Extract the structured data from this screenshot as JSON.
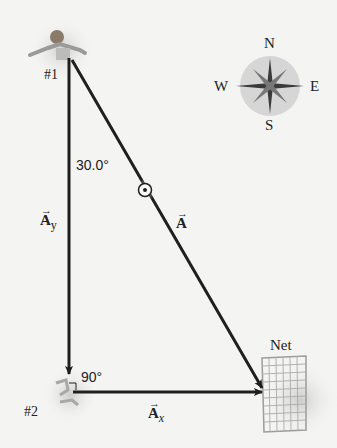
{
  "diagram": {
    "players": [
      {
        "id": "player-1",
        "label": "#1"
      },
      {
        "id": "player-2",
        "label": "#2"
      }
    ],
    "angles": {
      "top": "30.0°",
      "corner": "90°"
    },
    "vectors": {
      "A": {
        "symbol": "A",
        "arrow": "→"
      },
      "Ay": {
        "symbol": "A",
        "sub": "y",
        "arrow": "→"
      },
      "Ax": {
        "symbol": "A",
        "sub": "x",
        "arrow": "→"
      }
    },
    "net_label": "Net",
    "compass": {
      "N": "N",
      "S": "S",
      "E": "E",
      "W": "W"
    },
    "colors": {
      "vector": "#1f1f1f",
      "background": "#f4f4f2",
      "compass_disc": "#d6d6d6"
    }
  }
}
